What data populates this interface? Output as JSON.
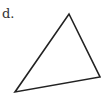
{
  "label": "d.",
  "shape": {
    "type": "triangle",
    "vertices": [
      [
        69,
        14
      ],
      [
        100,
        77
      ],
      [
        15,
        92
      ]
    ],
    "stroke": "#222222",
    "fill": "none"
  }
}
